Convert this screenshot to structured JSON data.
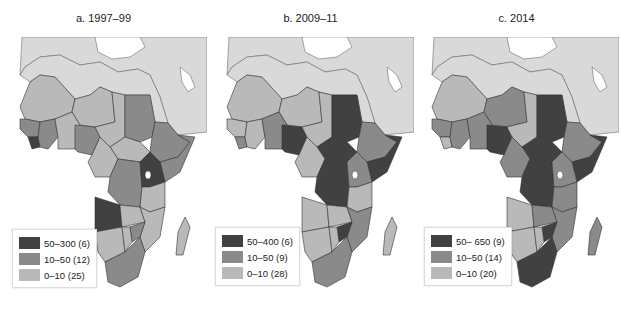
{
  "colors": {
    "high": "#414141",
    "mid": "#8a8a8a",
    "low": "#b9b9b9",
    "land_other": "#d9d9d9",
    "sea": "#ffffff",
    "border": "#333333"
  },
  "panels": [
    {
      "title": "a. 1997–99",
      "legend": [
        {
          "label": "50–300 (6)",
          "class": "high"
        },
        {
          "label": "10–50 (12)",
          "class": "mid"
        },
        {
          "label": "0–10 (25)",
          "class": "low"
        }
      ]
    },
    {
      "title": "b. 2009–11",
      "legend": [
        {
          "label": "50–400 (6)",
          "class": "high"
        },
        {
          "label": "10–50 (9)",
          "class": "mid"
        },
        {
          "label": "0–10 (28)",
          "class": "low"
        }
      ]
    },
    {
      "title": "c. 2014",
      "legend": [
        {
          "label": "50– 650 (9)",
          "class": "high"
        },
        {
          "label": "10–50 (14)",
          "class": "mid"
        },
        {
          "label": "0–10 (20)",
          "class": "low"
        }
      ]
    }
  ]
}
